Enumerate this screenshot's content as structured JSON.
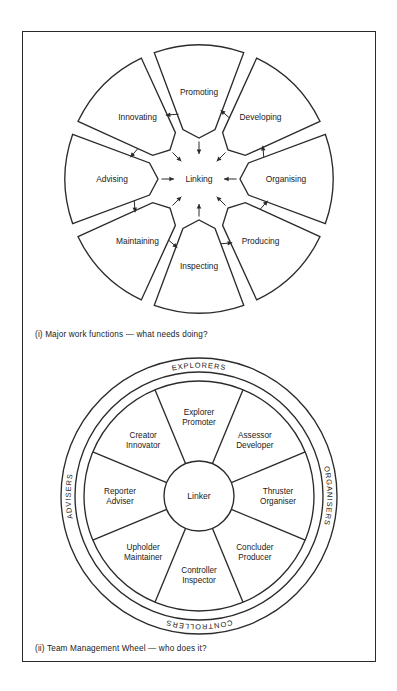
{
  "figure": {
    "panels": [
      {
        "id": "major-work-functions",
        "caption": "(i)  Major work functions — what needs doing?",
        "center_label": "Linking",
        "segments": [
          {
            "label": "Promoting",
            "angle_deg": -90
          },
          {
            "label": "Developing",
            "angle_deg": -45
          },
          {
            "label": "Organising",
            "angle_deg": 0
          },
          {
            "label": "Producing",
            "angle_deg": 45
          },
          {
            "label": "Inspecting",
            "angle_deg": 90
          },
          {
            "label": "Maintaining",
            "angle_deg": 135
          },
          {
            "label": "Advising",
            "angle_deg": 180
          },
          {
            "label": "Innovating",
            "angle_deg": -135
          }
        ]
      },
      {
        "id": "team-management-wheel",
        "caption": "(ii)  Team Management Wheel — who does it?",
        "center_label": "Linker",
        "sectors": [
          {
            "line1": "Explorer",
            "line2": "Promoter",
            "angle_deg": -90
          },
          {
            "line1": "Assessor",
            "line2": "Developer",
            "angle_deg": -45
          },
          {
            "line1": "Thruster",
            "line2": "Organiser",
            "angle_deg": 0
          },
          {
            "line1": "Concluder",
            "line2": "Producer",
            "angle_deg": 45
          },
          {
            "line1": "Controller",
            "line2": "Inspector",
            "angle_deg": 90
          },
          {
            "line1": "Upholder",
            "line2": "Maintainer",
            "angle_deg": 135
          },
          {
            "line1": "Reporter",
            "line2": "Adviser",
            "angle_deg": 180
          },
          {
            "line1": "Creator",
            "line2": "Innovator",
            "angle_deg": -135
          }
        ],
        "ring_labels": [
          {
            "text": "EXPLORERS",
            "position": "top"
          },
          {
            "text": "ORGANISERS",
            "position": "right"
          },
          {
            "text": "CONTROLLERS",
            "position": "bottom"
          },
          {
            "text": "ADVISERS",
            "position": "left"
          }
        ]
      }
    ]
  },
  "style": {
    "ink": "#2b2b2b",
    "paper": "#ffffff"
  }
}
